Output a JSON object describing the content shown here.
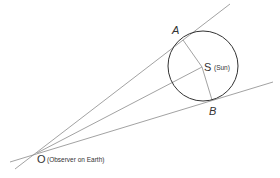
{
  "diagram": {
    "title": "",
    "colors": {
      "line": "#8a8a8a",
      "circle": "#333333",
      "text": "#333333"
    },
    "points": {
      "O": {
        "x": 37,
        "y": 153,
        "label": "O",
        "note": "(Observer on Earth)"
      },
      "S": {
        "x": 202,
        "y": 67,
        "label": "S",
        "note": "(Sun)"
      },
      "A": {
        "x": 183,
        "y": 40,
        "label": "A"
      },
      "B": {
        "x": 212,
        "y": 100,
        "label": "B"
      }
    },
    "circle": {
      "cx": 203,
      "cy": 66,
      "r": 35
    },
    "labels": {
      "A": "A",
      "B": "B",
      "S": "S",
      "S_note": "(Sun)",
      "O": "O",
      "O_note": "(Observer on Earth)"
    }
  }
}
